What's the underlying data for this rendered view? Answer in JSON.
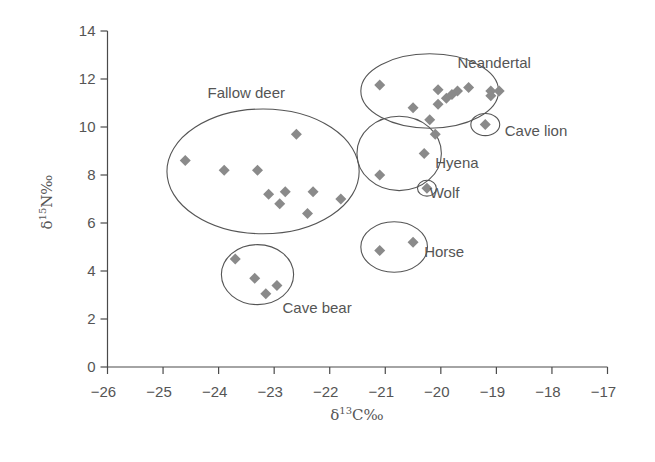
{
  "chart_data": {
    "type": "scatter",
    "title": "",
    "xlabel": "δ13C‰",
    "ylabel": "δ15N‰",
    "xlabel_parts": {
      "delta": "δ",
      "sup": "13",
      "element": "C‰"
    },
    "ylabel_parts": {
      "delta": "δ",
      "sup": "15",
      "element": "N‰"
    },
    "xlim": [
      -26,
      -17
    ],
    "ylim": [
      0,
      14
    ],
    "xticks": [
      -26,
      -25,
      -24,
      -23,
      -22,
      -21,
      -20,
      -19,
      -18,
      -17
    ],
    "xtick_labels": [
      "−26",
      "−25",
      "−24",
      "−23",
      "−22",
      "−21",
      "−20",
      "−19",
      "−18",
      "−17"
    ],
    "yticks": [
      0,
      2,
      4,
      6,
      8,
      10,
      12,
      14
    ],
    "ytick_labels": [
      "0",
      "2",
      "4",
      "6",
      "8",
      "10",
      "12",
      "14"
    ],
    "grid": false,
    "legend": "none (groups labeled directly next to ellipses)",
    "marker": {
      "shape": "diamond",
      "color": "#8a8a8a"
    },
    "series": [
      {
        "name": "Fallow deer",
        "points": [
          [
            -24.6,
            8.6
          ],
          [
            -23.9,
            8.2
          ],
          [
            -23.3,
            8.2
          ],
          [
            -22.6,
            9.7
          ],
          [
            -23.1,
            7.2
          ],
          [
            -22.9,
            6.8
          ],
          [
            -22.8,
            7.3
          ],
          [
            -22.3,
            7.3
          ],
          [
            -22.4,
            6.4
          ],
          [
            -21.8,
            7.0
          ]
        ],
        "ellipse": {
          "cx": -23.2,
          "cy": 8.15,
          "rx": 1.73,
          "ry": 2.6
        },
        "label_pos": [
          -24.2,
          11.4
        ]
      },
      {
        "name": "Cave bear",
        "points": [
          [
            -23.7,
            4.5
          ],
          [
            -23.35,
            3.7
          ],
          [
            -22.95,
            3.4
          ],
          [
            -23.15,
            3.05
          ]
        ],
        "ellipse": {
          "cx": -23.3,
          "cy": 3.85,
          "rx": 0.65,
          "ry": 1.25
        },
        "label_pos": [
          -22.85,
          2.45
        ]
      },
      {
        "name": "Neandertal",
        "points": [
          [
            -21.1,
            11.75
          ],
          [
            -20.5,
            10.8
          ],
          [
            -20.05,
            11.55
          ],
          [
            -20.05,
            10.95
          ],
          [
            -19.9,
            11.2
          ],
          [
            -19.8,
            11.35
          ],
          [
            -19.7,
            11.5
          ],
          [
            -19.5,
            11.65
          ],
          [
            -19.1,
            11.5
          ],
          [
            -19.1,
            11.3
          ],
          [
            -18.95,
            11.5
          ]
        ],
        "ellipse": {
          "cx": -20.2,
          "cy": 11.5,
          "rx": 1.24,
          "ry": 1.55
        },
        "label_pos": [
          -19.7,
          12.65
        ]
      },
      {
        "name": "Hyena",
        "points": [
          [
            -20.2,
            10.3
          ],
          [
            -20.1,
            9.7
          ],
          [
            -20.3,
            8.9
          ],
          [
            -21.1,
            8.0
          ]
        ],
        "ellipse": {
          "cx": -20.75,
          "cy": 8.9,
          "rx": 0.76,
          "ry": 1.55
        },
        "label_pos": [
          -20.1,
          8.5
        ]
      },
      {
        "name": "Wolf",
        "points": [
          [
            -20.25,
            7.45
          ]
        ],
        "ellipse": {
          "cx": -20.25,
          "cy": 7.45,
          "rx": 0.17,
          "ry": 0.33
        },
        "label_pos": [
          -20.2,
          7.25
        ]
      },
      {
        "name": "Cave lion",
        "points": [
          [
            -19.2,
            10.1
          ]
        ],
        "ellipse": {
          "cx": -19.2,
          "cy": 10.1,
          "rx": 0.26,
          "ry": 0.46
        },
        "label_pos": [
          -18.85,
          9.85
        ]
      },
      {
        "name": "Horse",
        "points": [
          [
            -21.1,
            4.85
          ],
          [
            -20.5,
            5.2
          ]
        ],
        "ellipse": {
          "cx": -20.84,
          "cy": 5.0,
          "rx": 0.6,
          "ry": 1.05
        },
        "label_pos": [
          -20.3,
          4.8
        ]
      }
    ]
  }
}
